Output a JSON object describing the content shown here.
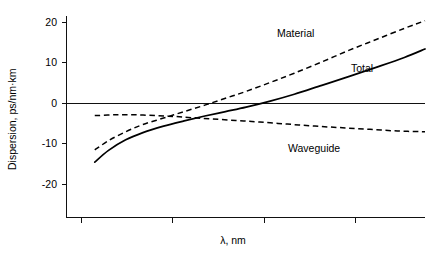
{
  "chart_data": {
    "type": "line",
    "title": "",
    "xlabel": "λ, nm",
    "ylabel": "Dispersion, ps/nm·km",
    "ylim": [
      -24,
      23
    ],
    "xlim": [
      0,
      100
    ],
    "grid": false,
    "legend_position": "inline-annotations",
    "y_ticks": [
      "20",
      "10",
      "0",
      "-10",
      "-20"
    ],
    "y_tick_values": [
      20,
      10,
      0,
      -10,
      -20
    ],
    "x_ticks": [
      "",
      "",
      "",
      ""
    ],
    "x_tick_count": 4,
    "zero_line": true,
    "series": [
      {
        "name": "Material",
        "style": "dashed",
        "label": "Material",
        "x": [
          4,
          8,
          13,
          18,
          24,
          30,
          36,
          42,
          48,
          55,
          62,
          70,
          78,
          86,
          94,
          100
        ],
        "values": [
          -11.5,
          -9.2,
          -7.0,
          -5.2,
          -3.6,
          -2.0,
          -0.4,
          1.3,
          3.0,
          5.2,
          7.5,
          10.3,
          13.2,
          15.9,
          18.6,
          20.5
        ]
      },
      {
        "name": "Total",
        "style": "solid",
        "label": "Total",
        "x": [
          4,
          8,
          13,
          18,
          24,
          30,
          36,
          42,
          48,
          55,
          62,
          70,
          78,
          86,
          94,
          100
        ],
        "values": [
          -14.5,
          -11.6,
          -9.0,
          -7.2,
          -5.6,
          -4.3,
          -3.1,
          -2.0,
          -0.9,
          0.6,
          2.3,
          4.5,
          6.7,
          9.0,
          11.4,
          13.5
        ]
      },
      {
        "name": "Waveguide",
        "style": "dashed",
        "label": "Waveguide",
        "x": [
          4,
          10,
          16,
          22,
          27,
          32,
          38,
          45,
          52,
          60,
          68,
          76,
          84,
          92,
          100
        ],
        "values": [
          -3.0,
          -2.8,
          -2.8,
          -3.0,
          -3.2,
          -3.5,
          -3.8,
          -4.2,
          -4.6,
          -5.1,
          -5.6,
          -6.0,
          -6.4,
          -6.8,
          -7.0
        ]
      }
    ],
    "annotations": [
      {
        "text": "Material",
        "series": "Material"
      },
      {
        "text": "Total",
        "series": "Total"
      },
      {
        "text": "Waveguide",
        "series": "Waveguide"
      }
    ]
  }
}
